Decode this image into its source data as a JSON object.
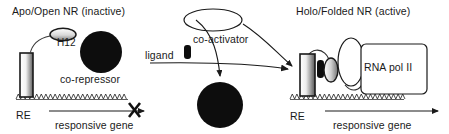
{
  "figure": {
    "type": "diagram",
    "width": 449,
    "height": 134,
    "background_color": "#ffffff",
    "stroke_color": "#1a1a1a",
    "text_color": "#1a1a1a"
  },
  "panels": {
    "left": {
      "title": "Apo/Open NR (inactive)",
      "state": "inactive",
      "labels": {
        "helix12": "H12",
        "corepressor": "co-repressor",
        "response_element": "RE",
        "gene": "responsive gene"
      },
      "transcription_blocked": true,
      "block_marker": "X"
    },
    "right": {
      "title": "Holo/Folded NR (active)",
      "state": "active",
      "labels": {
        "rna_polymerase": "RNA pol II",
        "response_element": "RE",
        "gene": "responsive gene"
      },
      "transcription_blocked": false
    },
    "middle": {
      "labels": {
        "coactivator": "co-activator",
        "ligand": "ligand"
      }
    }
  },
  "shapes": {
    "corepressor_fill": "#0d0d0d",
    "coactivator_fill": "#ffffff",
    "ligand_fill": "#0d0d0d",
    "receptor_gradient_from": "#f7f7f7",
    "receptor_gradient_to": "#6e6e6e",
    "helix12_gradient_from": "#ffffff",
    "helix12_gradient_to": "#8a8a8a",
    "rnapol_fill": "#ffffff"
  }
}
